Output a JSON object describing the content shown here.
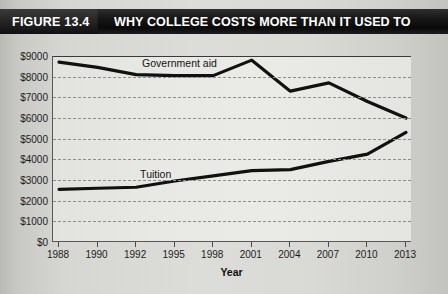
{
  "header": {
    "figure_number": "FIGURE 13.4",
    "title": "WHY COLLEGE COSTS MORE THAN IT USED TO",
    "bar_color": "#101010",
    "text_color": "#ffffff"
  },
  "chart_data": {
    "type": "line",
    "title": "WHY COLLEGE COSTS MORE THAN IT USED TO",
    "xlabel": "Year",
    "ylabel": "",
    "categories": [
      "1988",
      "1990",
      "1992",
      "1995",
      "1998",
      "2001",
      "2004",
      "2007",
      "2010",
      "2013"
    ],
    "ytick_labels": [
      "$9000",
      "$8000",
      "$7000",
      "$6000",
      "$5000",
      "$4000",
      "$3000",
      "$2000",
      "$1000",
      "$0"
    ],
    "ytick_values": [
      9000,
      8000,
      7000,
      6000,
      5000,
      4000,
      3000,
      2000,
      1000,
      0
    ],
    "ylim": [
      0,
      9000
    ],
    "grid": true,
    "grid_style": "dotted-horizontal",
    "legend": "inline-labels",
    "series": [
      {
        "name": "Government aid",
        "color": "#111111",
        "label_x": "1992",
        "values": [
          8700,
          8450,
          8100,
          8050,
          8050,
          8800,
          7300,
          7700,
          6800,
          6000
        ]
      },
      {
        "name": "Tuition",
        "color": "#111111",
        "label_x": "1992",
        "values": [
          2550,
          2600,
          2650,
          2950,
          3200,
          3450,
          3500,
          3900,
          4250,
          5300
        ]
      }
    ]
  }
}
